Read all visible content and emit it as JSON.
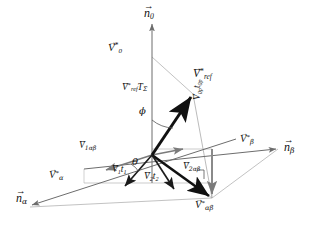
{
  "figure": {
    "type": "vector-diagram",
    "title": "",
    "background_color": "#ffffff",
    "axis_color": "#6d6d6d",
    "vector_color": "#111111",
    "construction_color": "#9a9a9a"
  },
  "axes": [
    {
      "id": "n0",
      "name": "n-zero-axis",
      "label_arrow": "→",
      "label_base": "n",
      "label_sub": "0",
      "label_sup": "",
      "x": 150,
      "y": 14,
      "anchor": "center"
    },
    {
      "id": "nbeta",
      "name": "n-beta-axis",
      "label_arrow": "→",
      "label_base": "n",
      "label_sub": "β",
      "label_sup": "",
      "x": 285,
      "y": 148,
      "anchor": "left"
    },
    {
      "id": "nalpha",
      "name": "n-alpha-axis",
      "label_arrow": "→",
      "label_base": "n",
      "label_sub": "α",
      "label_sup": "",
      "x": 18,
      "y": 200,
      "anchor": "left"
    }
  ],
  "labels": [
    {
      "id": "v0",
      "name": "label-v-star-zero",
      "arrow": "→",
      "base": "V",
      "sup": "*",
      "sub": "0",
      "x": 112,
      "y": 48,
      "size": 11
    },
    {
      "id": "vref",
      "name": "label-v-star-ref",
      "arrow": "→",
      "base": "V",
      "sup": "*",
      "sub": "ref",
      "x": 197,
      "y": 74,
      "size": 11
    },
    {
      "id": "vreftsig",
      "name": "label-v-star-ref-tsigma",
      "arrow": "→",
      "base": "V",
      "sup": "*",
      "sub": "ref",
      "x": 127,
      "y": 86,
      "size": 9.5,
      "tail_base": "T",
      "tail_sub": "Σ"
    },
    {
      "id": "v0pt0p",
      "name": "label-v0p-t0p",
      "arrow": "→",
      "base": "V",
      "sup": "",
      "sub": "0p",
      "x": 196,
      "y": 104,
      "size": 9.5,
      "tail_base": "t",
      "tail_sub": "0p",
      "rotate": -90
    },
    {
      "id": "vbeta",
      "name": "label-v-star-beta",
      "arrow": "→",
      "base": "V",
      "sup": "*",
      "sub": "β",
      "x": 243,
      "y": 140,
      "size": 10.5
    },
    {
      "id": "valpha",
      "name": "label-v-star-alpha",
      "arrow": "→",
      "base": "V",
      "sup": "*",
      "sub": "α",
      "x": 52,
      "y": 177,
      "size": 10.5
    },
    {
      "id": "v1ab",
      "name": "label-v1-alphabeta",
      "arrow": "→",
      "base": "V",
      "sup": "",
      "sub": "1αβ",
      "x": 82,
      "y": 147,
      "size": 9.5
    },
    {
      "id": "v2ab",
      "name": "label-v2-alphabeta",
      "arrow": "→",
      "base": "V",
      "sup": "",
      "sub": "2αβ",
      "x": 186,
      "y": 168,
      "size": 9.5
    },
    {
      "id": "v1t1",
      "name": "label-v1-t1",
      "arrow": "→",
      "base": "V",
      "sup": "",
      "sub": "1",
      "x": 115,
      "y": 170,
      "size": 9.5,
      "tail_base": "t",
      "tail_sub": "1"
    },
    {
      "id": "v2t2",
      "name": "label-v2-t2",
      "arrow": "→",
      "base": "V",
      "sup": "",
      "sub": "2",
      "x": 147,
      "y": 177,
      "size": 9.5,
      "tail_base": "t",
      "tail_sub": "2"
    },
    {
      "id": "vab",
      "name": "label-v-star-alphabeta",
      "arrow": "→",
      "base": "V",
      "sup": "*",
      "sub": "αβ",
      "x": 198,
      "y": 206,
      "size": 10.5
    }
  ],
  "angles": [
    {
      "id": "phi",
      "name": "angle-phi",
      "symbol": "ϕ",
      "x": 141,
      "y": 112,
      "description": "angle between n0 axis and reference vector"
    },
    {
      "id": "theta",
      "name": "angle-theta",
      "symbol": "θ",
      "x": 134,
      "y": 162,
      "description": "angle in the alpha-beta plane between V1 and the projected reference"
    }
  ],
  "geometry": {
    "origin": {
      "x": 152,
      "y": 155
    },
    "n0_tip": {
      "x": 152,
      "y": 22
    },
    "nbeta_tip": {
      "x": 278,
      "y": 149
    },
    "nalpha_tip": {
      "x": 30,
      "y": 207
    },
    "vref_tip": {
      "x": 193,
      "y": 94
    },
    "v0_point": {
      "x": 152,
      "y": 57
    },
    "vab_tip": {
      "x": 212,
      "y": 198
    },
    "v1_tip": {
      "x": 102,
      "y": 170
    },
    "v2_tip": {
      "x": 180,
      "y": 160
    },
    "v1t1_tip": {
      "x": 123,
      "y": 184
    },
    "v2t2_tip": {
      "x": 172,
      "y": 188
    }
  }
}
